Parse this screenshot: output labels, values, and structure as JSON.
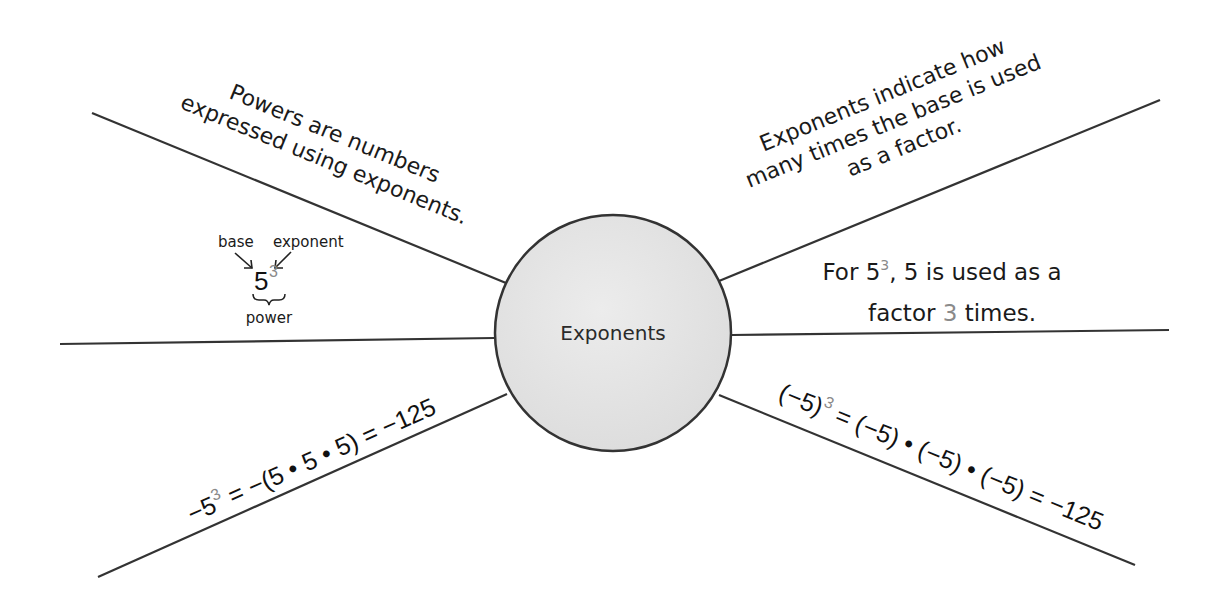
{
  "title": "Exponents",
  "colors": {
    "line": "#333333",
    "circle_fill": "#e6e6e6",
    "circle_stroke": "#333333",
    "exponent_gray": "#8a8a8a",
    "text": "#1a1a1a"
  },
  "center": {
    "label": "Exponents"
  },
  "branches": {
    "upper_left": {
      "line1": "Powers are numbers",
      "line2": "expressed using exponents."
    },
    "upper_right": {
      "line1": "Exponents indicate how",
      "line2": "many times the base is used",
      "line3": "as a factor."
    },
    "middle_left": {
      "base_label": "base",
      "exponent_label": "exponent",
      "base_value": "5",
      "exponent_value": "3",
      "power_label": "power"
    },
    "middle_right": {
      "line1_prefix": "For 5",
      "line1_exp": "3",
      "line1_suffix": ", 5 is used as a",
      "line2_prefix": "factor ",
      "line2_num": "3",
      "line2_suffix": " times."
    },
    "lower_left": {
      "lhs_base": "−5",
      "lhs_exp": "3",
      "rhs": " = −(5 • 5 • 5) = −125"
    },
    "lower_right": {
      "lhs_base": "(−5)",
      "lhs_exp": "3",
      "rhs": " = (−5) • (−5) • (−5) = −125"
    }
  }
}
